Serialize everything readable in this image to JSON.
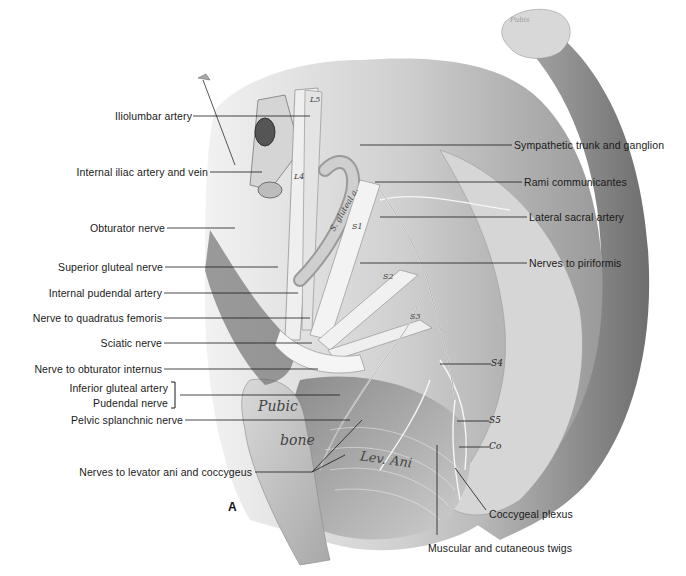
{
  "figure": {
    "panel_letter": "A",
    "left_labels": [
      {
        "id": "iliolumbar-artery",
        "text": "Iliolumbar artery",
        "y": 116
      },
      {
        "id": "internal-iliac-artery-vein",
        "text": "Internal iliac artery and vein",
        "y": 172
      },
      {
        "id": "obturator-nerve",
        "text": "Obturator nerve",
        "y": 228
      },
      {
        "id": "superior-gluteal-nerve",
        "text": "Superior gluteal nerve",
        "y": 267
      },
      {
        "id": "internal-pudendal-artery",
        "text": "Internal pudendal artery",
        "y": 293
      },
      {
        "id": "nerve-to-quadratus-femoris",
        "text": "Nerve to quadratus femoris",
        "y": 318
      },
      {
        "id": "sciatic-nerve",
        "text": "Sciatic nerve",
        "y": 343
      },
      {
        "id": "nerve-to-obturator-internus",
        "text": "Nerve to obturator internus",
        "y": 369
      },
      {
        "id": "inferior-gluteal-artery",
        "text": "Inferior gluteal artery",
        "y": 388
      },
      {
        "id": "pudendal-nerve",
        "text": "Pudendal nerve",
        "y": 403
      },
      {
        "id": "pelvic-splanchnic-nerve",
        "text": "Pelvic splanchnic nerve",
        "y": 420
      },
      {
        "id": "nerves-to-levator-ani",
        "text": "Nerves to levator ani and coccygeus",
        "y": 472
      }
    ],
    "right_labels": [
      {
        "id": "sympathetic-trunk",
        "text": "Sympathetic trunk and ganglion",
        "y": 145
      },
      {
        "id": "rami-communicantes",
        "text": "Rami communicantes",
        "y": 182
      },
      {
        "id": "lateral-sacral-artery",
        "text": "Lateral sacral artery",
        "y": 217
      },
      {
        "id": "nerves-to-piriformis",
        "text": "Nerves to piriformis",
        "y": 263
      },
      {
        "id": "coccygeal-plexus",
        "text": "Coccygeal plexus",
        "y": 514
      },
      {
        "id": "muscular-cutaneous-twigs",
        "text": "Muscular and cutaneous twigs",
        "y": 548
      }
    ],
    "inline_labels": {
      "s4": "S4",
      "s5": "S5",
      "co": "Co",
      "l4": "L4",
      "l5": "L5",
      "s1": "S1",
      "s2": "S2",
      "s3": "S3",
      "pubic": "Pubic",
      "bone": "bone",
      "lev_ani": "Lev. Ani",
      "s_gluteal_a": "S. gluteal a.",
      "pubis": "Pubis"
    }
  }
}
